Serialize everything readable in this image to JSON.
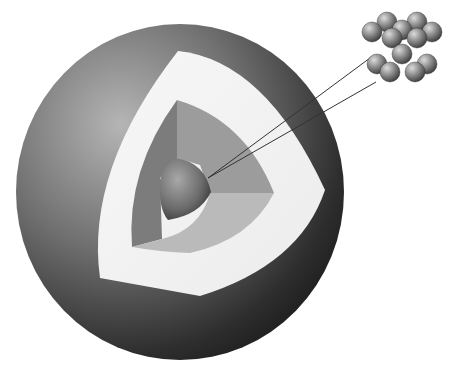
{
  "diagram": {
    "title": "",
    "colors": {
      "background": "#ffffff",
      "outer_shell_light": "#8c8c8c",
      "outer_shell_dark": "#1e1e1e",
      "middle_shell": "#f2f2f2",
      "inner_shell_left": "#7a7a7a",
      "inner_shell_top": "#9a9a9a",
      "inner_shell_bottom": "#b8b8b8",
      "core": "#6e6e6e",
      "leader_lines": "#333333",
      "atom": "#8a8a8a"
    },
    "layers": [
      {
        "name": "outer-shell"
      },
      {
        "name": "middle-shell"
      },
      {
        "name": "inner-shell"
      },
      {
        "name": "core"
      }
    ],
    "inset": {
      "name": "atom-cluster",
      "rows": 2,
      "atoms_per_row": 6
    }
  }
}
